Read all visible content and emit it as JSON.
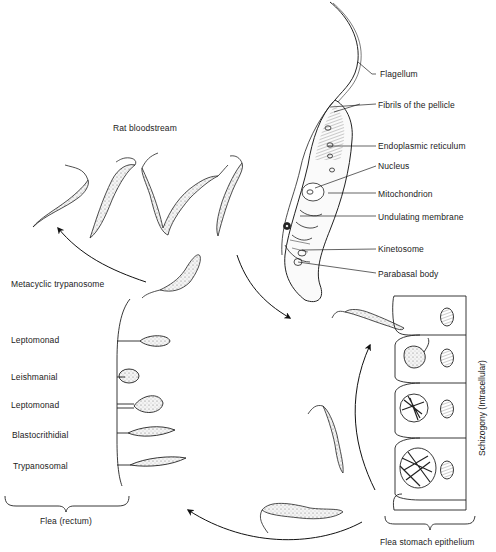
{
  "diagram": {
    "structure_labels": {
      "flagellum": "Flagellum",
      "fibrils": "Fibrils of the pellicle",
      "endoplasmic_reticulum": "Endoplasmic reticulum",
      "nucleus": "Nucleus",
      "mitochondrion": "Mitochondrion",
      "undulating_membrane": "Undulating membrane",
      "kinetosome": "Kinetosome",
      "parabasal_body": "Parabasal body"
    },
    "stages": {
      "rat_bloodstream": "Rat bloodstream",
      "metacyclic": "Metacyclic trypanosome",
      "schizogony": "Schizogony (Intracellular)",
      "flea_stomach": "Flea stomach epithelium",
      "flea_rectum": "Flea (rectum)"
    },
    "rectal_forms": [
      {
        "label": "Leptomonad"
      },
      {
        "label": "Leishmanial"
      },
      {
        "label": "Leptomonad"
      },
      {
        "label": "Blastocrithidial"
      },
      {
        "label": "Trypanosomal"
      }
    ],
    "colors": {
      "ink": "#1a1a1a",
      "stipple": "#d9d9d9",
      "background": "#ffffff"
    }
  }
}
